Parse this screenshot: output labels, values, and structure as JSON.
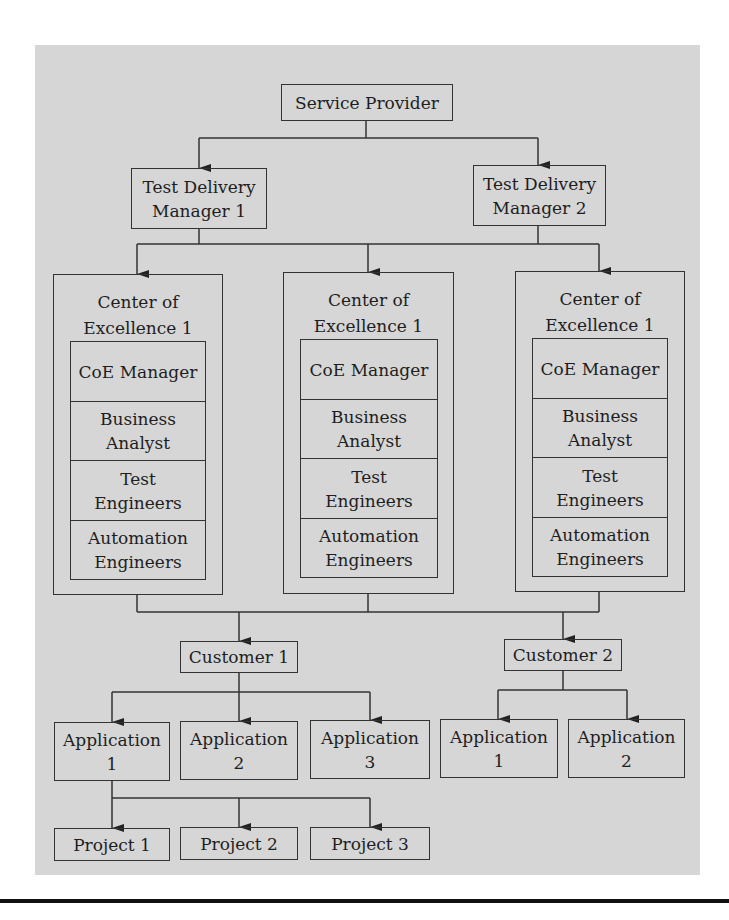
{
  "diagram": {
    "root": {
      "label": "Service Provider"
    },
    "managers": [
      {
        "label_line1": "Test Delivery",
        "label_line2": "Manager 1"
      },
      {
        "label_line1": "Test Delivery",
        "label_line2": "Manager 2"
      }
    ],
    "centers": [
      {
        "title_line1": "Center of",
        "title_line2": "Excellence 1",
        "roles": [
          {
            "line1": "CoE Manager",
            "line2": ""
          },
          {
            "line1": "Business",
            "line2": "Analyst"
          },
          {
            "line1": "Test",
            "line2": "Engineers"
          },
          {
            "line1": "Automation",
            "line2": "Engineers"
          }
        ]
      },
      {
        "title_line1": "Center of",
        "title_line2": "Excellence 1",
        "roles": [
          {
            "line1": "CoE Manager",
            "line2": ""
          },
          {
            "line1": "Business",
            "line2": "Analyst"
          },
          {
            "line1": "Test",
            "line2": "Engineers"
          },
          {
            "line1": "Automation",
            "line2": "Engineers"
          }
        ]
      },
      {
        "title_line1": "Center of",
        "title_line2": "Excellence 1",
        "roles": [
          {
            "line1": "CoE Manager",
            "line2": ""
          },
          {
            "line1": "Business",
            "line2": "Analyst"
          },
          {
            "line1": "Test",
            "line2": "Engineers"
          },
          {
            "line1": "Automation",
            "line2": "Engineers"
          }
        ]
      }
    ],
    "customers": [
      {
        "label": "Customer 1",
        "applications": [
          {
            "line1": "Application",
            "line2": "1"
          },
          {
            "line1": "Application",
            "line2": "2"
          },
          {
            "line1": "Application",
            "line2": "3"
          }
        ],
        "projects": [
          "Project 1",
          "Project 2",
          "Project 3"
        ]
      },
      {
        "label": "Customer 2",
        "applications": [
          {
            "line1": "Application",
            "line2": "1"
          },
          {
            "line1": "Application",
            "line2": "2"
          }
        ]
      }
    ],
    "colors": {
      "panel": "#d6d6d6",
      "stroke": "#333333",
      "rule": "#111111"
    }
  }
}
